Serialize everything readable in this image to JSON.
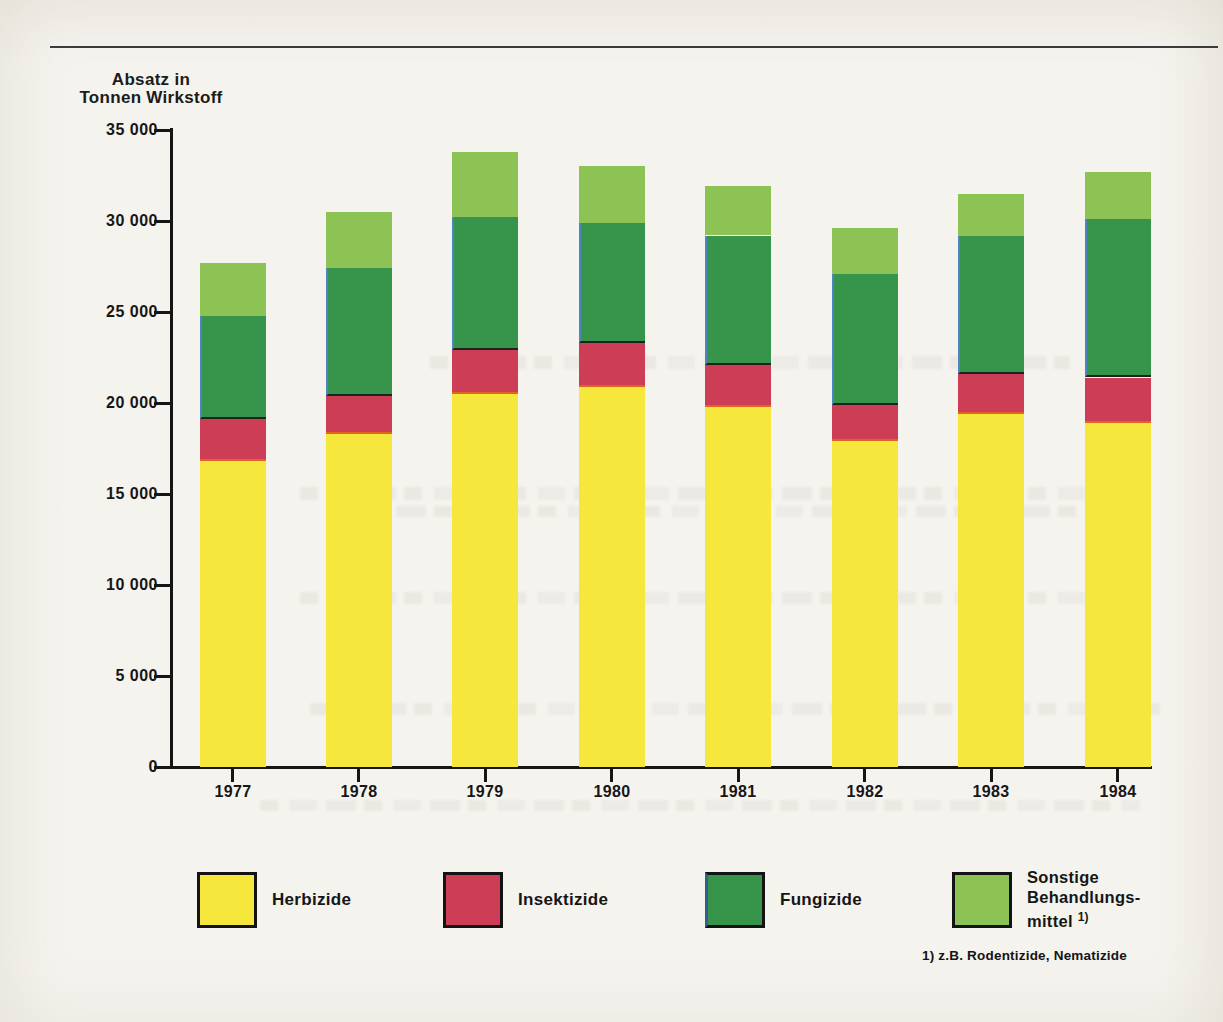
{
  "page": {
    "title_line1": "Absatz in",
    "title_line2": "Tonnen Wirkstoff",
    "footnote": "1) z.B. Rodentizide, Nematizide"
  },
  "chart_data": {
    "type": "bar",
    "stacked": true,
    "title": "Absatz in Tonnen Wirkstoff",
    "ylabel": "Absatz in Tonnen Wirkstoff",
    "xlabel": "",
    "categories": [
      "1977",
      "1978",
      "1979",
      "1980",
      "1981",
      "1982",
      "1983",
      "1984"
    ],
    "series": [
      {
        "name": "Herbizide",
        "color": "#f5e73c",
        "values": [
          16800,
          18300,
          20500,
          20900,
          19800,
          17900,
          19400,
          18900
        ]
      },
      {
        "name": "Insektizide",
        "color": "#cd3d56",
        "values": [
          2300,
          2100,
          2400,
          2400,
          2300,
          2000,
          2200,
          2500
        ]
      },
      {
        "name": "Fungizide",
        "color": "#36954b",
        "values": [
          5700,
          7000,
          7300,
          6600,
          7100,
          7200,
          7600,
          8700
        ]
      },
      {
        "name": "Sonstige Behandlungsmittel",
        "color": "#8dc254",
        "values": [
          2900,
          3100,
          3600,
          3100,
          2700,
          2500,
          2300,
          2600
        ]
      }
    ],
    "totals": [
      27700,
      30500,
      33800,
      33000,
      31900,
      29600,
      31500,
      32700
    ],
    "ylim": [
      0,
      35000
    ],
    "yticks": [
      0,
      5000,
      10000,
      15000,
      20000,
      25000,
      30000,
      35000
    ],
    "ytick_labels": [
      "0",
      "5 000",
      "10 000",
      "15 000",
      "20 000",
      "25 000",
      "30 000",
      "35 000"
    ],
    "grid": false,
    "legend_position": "bottom"
  },
  "legend": {
    "items": [
      {
        "label": "Herbizide"
      },
      {
        "label": "Insektizide"
      },
      {
        "label": "Fungizide"
      },
      {
        "label_lines": [
          "Sonstige",
          "Behandlungs-",
          "mittel"
        ],
        "superscript": "1)"
      }
    ]
  }
}
